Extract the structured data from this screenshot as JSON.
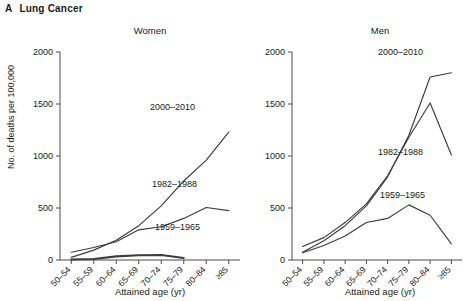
{
  "figure": {
    "panel_letter": "A",
    "panel_title": "Lung Cancer",
    "y_axis_label": "No. of deaths per 100,000",
    "x_axis_label": "Attained age (yr)"
  },
  "chart_data": [
    {
      "type": "line",
      "title": "Women",
      "xlabel": "Attained age (yr)",
      "ylabel": "No. of deaths per 100,000",
      "categories": [
        "50–54",
        "55–59",
        "60–64",
        "65–69",
        "70–74",
        "75–79",
        "80–84",
        "≥85"
      ],
      "ylim": [
        0,
        2000
      ],
      "yticks": [
        0,
        500,
        1000,
        1500,
        2000
      ],
      "grid": false,
      "legend": "inline-annotations",
      "series": [
        {
          "name": "2000–2010",
          "values": [
            25,
            95,
            190,
            330,
            520,
            760,
            960,
            1230
          ]
        },
        {
          "name": "1982–1988",
          "values": [
            75,
            120,
            175,
            290,
            320,
            400,
            505,
            475
          ]
        },
        {
          "name": "1959–1965",
          "values": [
            5,
            10,
            35,
            45,
            48,
            20,
            null,
            null
          ]
        }
      ]
    },
    {
      "type": "line",
      "title": "Men",
      "xlabel": "Attained age (yr)",
      "ylabel": "No. of deaths per 100,000",
      "categories": [
        "50–54",
        "55–59",
        "60–64",
        "65–69",
        "70–74",
        "75–79",
        "80–84",
        "≥85"
      ],
      "ylim": [
        0,
        2000
      ],
      "yticks": [
        0,
        500,
        1000,
        1500,
        2000
      ],
      "grid": false,
      "legend": "inline-annotations",
      "series": [
        {
          "name": "2000–2010",
          "values": [
            75,
            185,
            330,
            520,
            800,
            1200,
            1760,
            1800
          ]
        },
        {
          "name": "1982–1988",
          "values": [
            130,
            215,
            360,
            540,
            810,
            1180,
            1510,
            1010
          ]
        },
        {
          "name": "1959–1965",
          "values": [
            70,
            140,
            230,
            360,
            400,
            530,
            430,
            155
          ]
        }
      ]
    }
  ],
  "annotations": {
    "women": [
      {
        "text": "2000–2010",
        "series": "2000–2010"
      },
      {
        "text": "1982–1988",
        "series": "1982–1988"
      },
      {
        "text": "1959–1965",
        "series": "1959–1965"
      }
    ],
    "men": [
      {
        "text": "2000–2010",
        "series": "2000–2010"
      },
      {
        "text": "1982–1988",
        "series": "1982–1988"
      },
      {
        "text": "1959–1965",
        "series": "1959–1965"
      }
    ]
  },
  "colors": {
    "line": "#3c3c3c",
    "axis": "#4a4a4a",
    "text": "#1a1a1a",
    "background": "#ffffff"
  }
}
